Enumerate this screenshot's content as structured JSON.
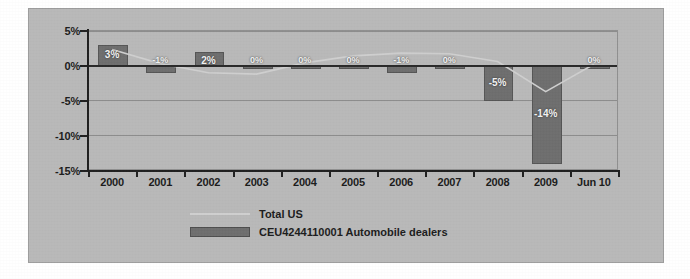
{
  "chart_data": {
    "type": "bar",
    "title": "",
    "subtitle": "",
    "xlabel": "",
    "ylabel": "",
    "categories": [
      "2000",
      "2001",
      "2002",
      "2003",
      "2004",
      "2005",
      "2006",
      "2007",
      "2008",
      "2009",
      "Jun 10"
    ],
    "ylim": [
      -15,
      5
    ],
    "yticks": [
      5,
      0,
      -5,
      -10,
      -15
    ],
    "ytick_labels": [
      "5%",
      "0%",
      "-5%",
      "-10%",
      "-15%"
    ],
    "grid": true,
    "legend_position": "bottom",
    "series": [
      {
        "name": "CEU4244110001  Automobile dealers",
        "type": "bar",
        "color": "#6e6e6e",
        "values": [
          3,
          -1,
          2,
          0,
          0,
          0,
          -1,
          0,
          -5,
          -14,
          0
        ],
        "data_labels": [
          "3%",
          "-1%",
          "2%",
          "0%",
          "0%",
          "0%",
          "-1%",
          "0%",
          "-5%",
          "-14%",
          "0%"
        ]
      },
      {
        "name": "Total US",
        "type": "line",
        "color": "#cfcfcf",
        "values": [
          2.2,
          0.2,
          -1.1,
          -1.3,
          0.3,
          1.3,
          1.7,
          1.6,
          0.5,
          -3.8,
          0.1
        ]
      }
    ]
  },
  "legend": {
    "items": [
      {
        "label": "Total US",
        "marker": "line",
        "code": "",
        "name": ""
      },
      {
        "label": "CEU4244110001  Automobile dealers",
        "marker": "bar",
        "code": "CEU4244110001",
        "name": "Automobile dealers"
      }
    ]
  }
}
